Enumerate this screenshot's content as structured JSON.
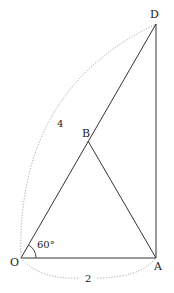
{
  "diagram": {
    "points": {
      "O": {
        "label": "O",
        "x": 21,
        "y": 258
      },
      "A": {
        "label": "A",
        "x": 156,
        "y": 258
      },
      "B": {
        "label": "B",
        "x": 88,
        "y": 141
      },
      "D": {
        "label": "D",
        "x": 156,
        "y": 24
      }
    },
    "labels": {
      "angle": "60°",
      "length_OD": "4",
      "length_OA": "2"
    },
    "colors": {
      "line": "#333333",
      "dotted": "#9a9a9a",
      "text": "#222222"
    }
  }
}
